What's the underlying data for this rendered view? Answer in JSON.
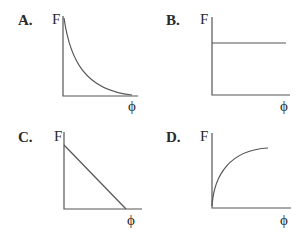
{
  "panels": [
    {
      "id": "A",
      "label": "A.",
      "y_axis_label": "F",
      "x_axis_label": "ϕ",
      "shape": "decaying curve (F decreases rapidly then levels off toward zero)"
    },
    {
      "id": "B",
      "label": "B.",
      "y_axis_label": "F",
      "x_axis_label": "ϕ",
      "shape": "horizontal line (F constant)"
    },
    {
      "id": "C",
      "label": "C.",
      "y_axis_label": "F",
      "x_axis_label": "ϕ",
      "shape": "straight line decreasing linearly to zero"
    },
    {
      "id": "D",
      "label": "D.",
      "y_axis_label": "F",
      "x_axis_label": "ϕ",
      "shape": "rising curve leveling off (saturating)"
    }
  ],
  "colors": {
    "line": "#555555",
    "text": "#2a2a2a",
    "background": "#ffffff"
  }
}
